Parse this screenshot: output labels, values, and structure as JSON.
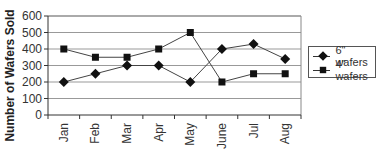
{
  "chart_data": {
    "type": "line",
    "title": "",
    "xlabel": "",
    "ylabel": "Number of Wafers Sold",
    "categories": [
      "Jan",
      "Feb",
      "Mar",
      "Apr",
      "May",
      "June",
      "Jul",
      "Aug"
    ],
    "series": [
      {
        "name": "6\" wafers",
        "marker": "diamond",
        "values": [
          200,
          250,
          300,
          300,
          200,
          400,
          430,
          340
        ]
      },
      {
        "name": "4\" wafers",
        "marker": "square",
        "values": [
          400,
          350,
          350,
          400,
          500,
          200,
          250,
          250
        ]
      }
    ],
    "ylim": [
      0,
      600
    ],
    "yticks": [
      0,
      100,
      200,
      300,
      400,
      500,
      600
    ],
    "grid": true,
    "legend_position": "right"
  },
  "legend": {
    "items": [
      {
        "label": "6\" wafers"
      },
      {
        "label": "4\" wafers"
      }
    ]
  }
}
